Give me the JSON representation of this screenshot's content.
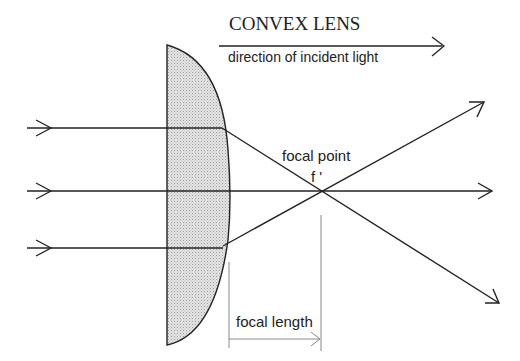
{
  "title": "CONVEX LENS",
  "labels": {
    "direction": "direction of incident light",
    "focal_point": "focal point",
    "focal_point_symbol": "f '",
    "focal_length": "focal length"
  },
  "colors": {
    "stroke": "#222222",
    "lens_fill": "#d9d9d9",
    "guide": "#888888",
    "background": "#ffffff"
  },
  "geometry": {
    "lens": {
      "flat_x": 167,
      "top_y": 45,
      "bottom_y": 345,
      "bulge_x": 230
    },
    "focal_point": {
      "x": 321,
      "y": 191
    },
    "incident_rays_y": [
      128,
      191,
      248
    ],
    "exit_points": [
      [
        222,
        128
      ],
      [
        230,
        191
      ],
      [
        223,
        246
      ]
    ],
    "ray_ends": [
      [
        484,
        102
      ],
      [
        492,
        191
      ],
      [
        499,
        302
      ]
    ]
  }
}
